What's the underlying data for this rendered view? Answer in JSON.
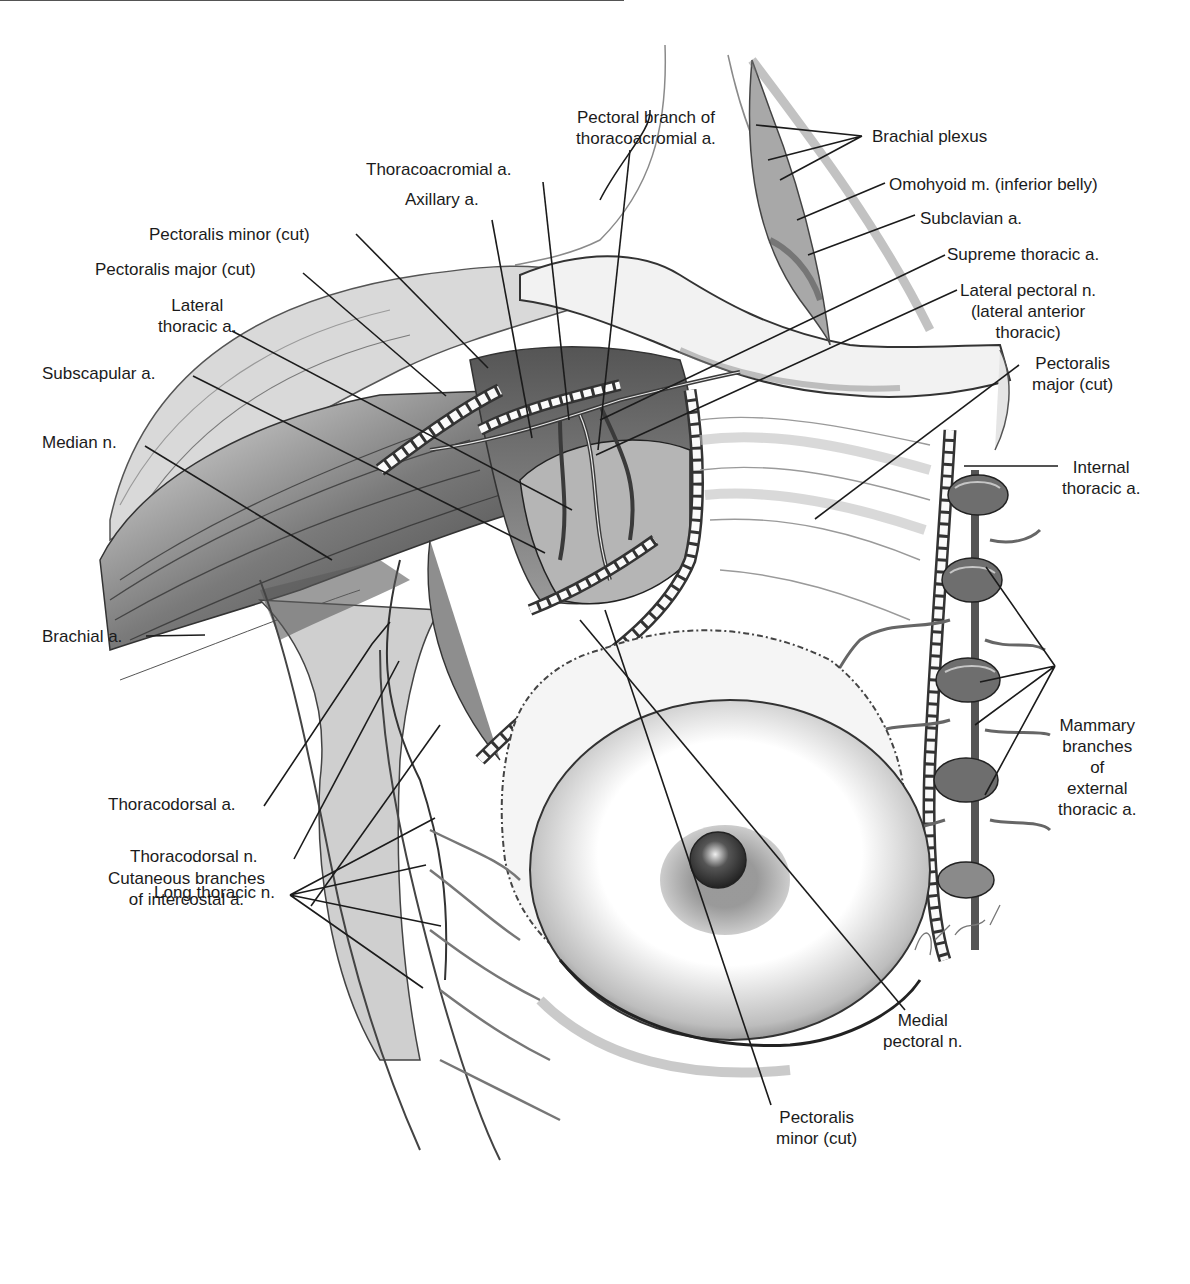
{
  "figure": {
    "type": "anatomical-illustration",
    "colors": {
      "ink": "#1b1b1b",
      "shade_dark": "#4a4a4a",
      "shade_mid": "#8c8c8c",
      "shade_light": "#c8c8c8",
      "background": "#ffffff"
    },
    "labels": {
      "pectoral_branch": [
        "Pectoral branch of",
        "thoracoacromial a."
      ],
      "thoracoacromial": [
        "Thoracoacromial a."
      ],
      "axillary": [
        "Axillary a."
      ],
      "pec_minor_cut_top": [
        "Pectoralis minor (cut)"
      ],
      "pec_major_cut_left": [
        "Pectoralis major (cut)"
      ],
      "lateral_thoracic": [
        "Lateral",
        "thoracic a."
      ],
      "subscapular": [
        "Subscapular a."
      ],
      "median_n": [
        "Median n."
      ],
      "brachial_a": [
        "Brachial a."
      ],
      "thoracodorsal_a": [
        "Thoracodorsal a."
      ],
      "thoracodorsal_n": [
        "Thoracodorsal n."
      ],
      "long_thoracic_n": [
        "Long thoracic n."
      ],
      "cutaneous_branches": [
        "Cutaneous branches",
        "of intercostal a."
      ],
      "brachial_plexus": [
        "Brachial plexus"
      ],
      "omohyoid": [
        "Omohyoid m. (inferior belly)"
      ],
      "subclavian": [
        "Subclavian a."
      ],
      "supreme_thoracic": [
        "Supreme thoracic a."
      ],
      "lateral_pectoral_n": [
        "Lateral pectoral n.",
        "(lateral anterior",
        "thoracic)"
      ],
      "pec_major_cut_right": [
        "Pectoralis",
        "major (cut)"
      ],
      "internal_thoracic": [
        "Internal",
        "thoracic a."
      ],
      "mammary_branches": [
        "Mammary",
        "branches",
        "of",
        "external",
        "thoracic a."
      ],
      "medial_pectoral_n": [
        "Medial",
        "pectoral n."
      ],
      "pec_minor_cut_bottom": [
        "Pectoralis",
        "minor (cut)"
      ]
    },
    "signature": "artist signature (illegible)",
    "caption_visible": "caption text cropped at bottom edge (illegible)"
  }
}
